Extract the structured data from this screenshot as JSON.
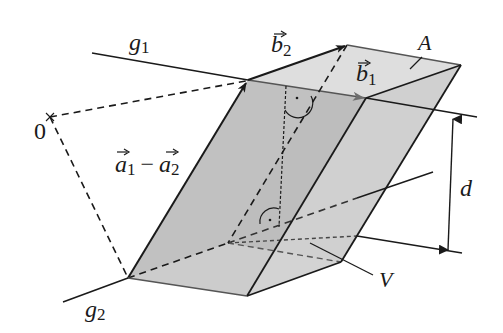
{
  "figure": {
    "colors": {
      "line": "#1a1a1a",
      "face_dark": "#b9b9b9",
      "face_mid": "#c9c9c9",
      "face_light": "#dcdcdc",
      "face_right": "#d2d2d2",
      "b1_arrow": "#6e6e6e",
      "background": "#ffffff"
    },
    "labels": {
      "g1": {
        "base": "g",
        "sub": "1"
      },
      "g2": {
        "base": "g",
        "sub": "2"
      },
      "origin": "0",
      "b1": {
        "base": "b",
        "sub": "1"
      },
      "b2": {
        "base": "b",
        "sub": "2"
      },
      "a_diff": {
        "a1_base": "a",
        "a1_sub": "1",
        "minus": "−",
        "a2_base": "a",
        "a2_sub": "2"
      },
      "A": "A",
      "V": "V",
      "d": "d"
    },
    "points": {
      "O": [
        50,
        117
      ],
      "P1": [
        248,
        80
      ],
      "P2": [
        128,
        278
      ],
      "B2_tip": [
        347,
        45
      ],
      "TopBackRight": [
        461,
        65
      ],
      "B1_tip": [
        366,
        98
      ],
      "BottomFront": [
        247,
        296
      ],
      "BottomRight": [
        341,
        262
      ],
      "RightMid": [
        357,
        236
      ]
    }
  }
}
